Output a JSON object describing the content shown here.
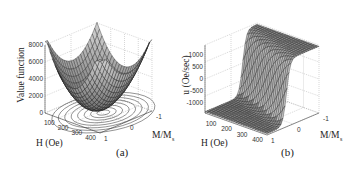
{
  "chart_data": [
    {
      "type": "surface3d",
      "panel_label": "(a)",
      "zlabel": "Value function",
      "xlabel": "H (Oe)",
      "ylabel": "M/M_s",
      "ylabel_main": "M/M",
      "ylabel_sub": "s",
      "z_ticks": [
        "0",
        "2000",
        "4000",
        "6000",
        "8000"
      ],
      "x_ticks": [
        "100",
        "200",
        "300",
        "400"
      ],
      "y_ticks": [
        "1",
        "0",
        "-1"
      ],
      "zlim": [
        0,
        8000
      ],
      "xlim": [
        0,
        400
      ],
      "ylim": [
        -1,
        1
      ],
      "grid": true,
      "description": "Bowl-shaped (paraboloid-like) value function surface with minimum near H≈200 Oe, M/Ms≈0; contour lines projected on base plane",
      "sample_surface": {
        "H": [
          0,
          100,
          200,
          300,
          400
        ],
        "M_over_Ms": [
          -1,
          0,
          1
        ],
        "approx_max": 8000,
        "approx_min": 0
      }
    },
    {
      "type": "surface3d",
      "panel_label": "(b)",
      "zlabel": "u (Oe/sec)",
      "xlabel": "H (Oe)",
      "ylabel": "M/M_s",
      "ylabel_main": "M/M",
      "ylabel_sub": "s",
      "z_ticks": [
        "-1000",
        "-500",
        "0",
        "500",
        "1000"
      ],
      "x_ticks": [
        "100",
        "200",
        "300",
        "400"
      ],
      "y_ticks": [
        "1",
        "0",
        "-1"
      ],
      "zlim": [
        -1000,
        1000
      ],
      "xlim": [
        0,
        400
      ],
      "ylim": [
        -1,
        1
      ],
      "grid": true,
      "description": "Bang-bang style control surface: saturates at +1000 on one side and -1000 on the other, with steep switching transition across the diagonal",
      "sample_surface": {
        "high_plateau": 1000,
        "low_plateau": -1000
      }
    }
  ]
}
